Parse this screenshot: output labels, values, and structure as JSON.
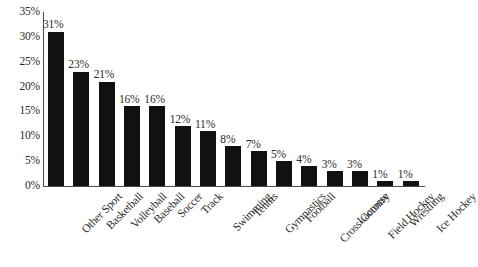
{
  "chart_data": {
    "type": "bar",
    "title": "",
    "subtitle": "",
    "xlabel": "",
    "ylabel": "",
    "ylim": [
      0,
      35
    ],
    "ytick_step": 5,
    "ytick_labels": [
      "35%",
      "30%",
      "25%",
      "20%",
      "15%",
      "10%",
      "5%",
      "0%"
    ],
    "ytick_values": [
      35,
      30,
      25,
      20,
      15,
      10,
      5,
      0
    ],
    "grid": false,
    "legend": false,
    "legend_position": "none",
    "bar_color": "#111111",
    "axis_color": "#4a4a4a",
    "text_color": "#2b2b2b",
    "value_label_suffix": "%",
    "categories": [
      "Other Sport",
      "Basketball",
      "Volleyball",
      "Baseball",
      "Soccer",
      "Track",
      "Swimming",
      "Tennis",
      "Gymnastics",
      "Football",
      "Cross-Country",
      "Lacrosse",
      "Field Hockey",
      "Wrestling",
      "Ice Hockey"
    ],
    "values": [
      31,
      23,
      21,
      16,
      16,
      12,
      11,
      8,
      7,
      5,
      4,
      3,
      3,
      1,
      1
    ],
    "value_labels": [
      "31%",
      "23%",
      "21%",
      "16%",
      "16%",
      "12%",
      "11%",
      "8%",
      "7%",
      "5%",
      "4%",
      "3%",
      "3%",
      "1%",
      "1%"
    ]
  }
}
